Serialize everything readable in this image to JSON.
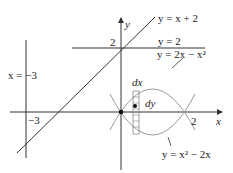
{
  "diagram": {
    "type": "region-between-curves",
    "axes": {
      "x_label": "x",
      "y_label": "y",
      "x_ticks": [
        {
          "value": -3,
          "label": "−3"
        },
        {
          "value": 2,
          "label": "2"
        }
      ],
      "y_ticks": [
        {
          "value": 2,
          "label": "2"
        }
      ]
    },
    "curves": [
      {
        "id": "line-x-plus-2",
        "label": "y = x + 2",
        "equation": "y = x + 2"
      },
      {
        "id": "line-y-2",
        "label": "y = 2",
        "equation": "y = 2"
      },
      {
        "id": "line-x-neg3",
        "label": "x = −3",
        "equation": "x = -3"
      },
      {
        "id": "parabola-down",
        "label": "y = 2x − x²",
        "equation": "y = 2x - x^2"
      },
      {
        "id": "parabola-up",
        "label": "y = x² − 2x",
        "equation": "y = x^2 - 2x"
      }
    ],
    "element_labels": {
      "dx": "dx",
      "dy": "dy"
    },
    "colors": {
      "lines": "#333333",
      "parabolas": "#999999",
      "strip": "#888888",
      "background": "#ffffff"
    }
  }
}
